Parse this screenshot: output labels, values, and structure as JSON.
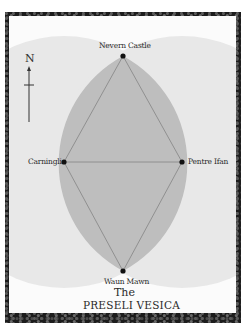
{
  "map": {
    "title_line1": "The",
    "title_line2": "PRESELI VESICA",
    "compass": {
      "label": "N",
      "icon": "north-arrow-icon"
    },
    "places": [
      {
        "name": "Nevern Castle",
        "position": "top",
        "x": 123,
        "y": 56
      },
      {
        "name": "Carningli",
        "position": "left",
        "x": 64,
        "y": 162
      },
      {
        "name": "Pentre Ifan",
        "position": "right",
        "x": 182,
        "y": 162
      },
      {
        "name": "Waun Mawn",
        "position": "bottom",
        "x": 123,
        "y": 271
      }
    ],
    "colors": {
      "frame": "#1c1c1c",
      "canvas": "#fbfbfb",
      "background_circles": "#e8e8e8",
      "vesica_fill": "#bebebe",
      "lines": "#8a8a8a",
      "points": "#111111",
      "text": "#2a2a2a"
    }
  }
}
